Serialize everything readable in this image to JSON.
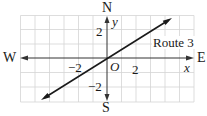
{
  "diagram": {
    "type": "coordinate-plane-with-route",
    "compass": {
      "north": "N",
      "south": "S",
      "east": "E",
      "west": "W"
    },
    "axes": {
      "x_label": "x",
      "y_label": "y",
      "origin_label": "O"
    },
    "ticks": {
      "x_neg": "−2",
      "x_pos": "2",
      "y_pos": "2",
      "y_neg": "−2"
    },
    "route_label": "Route 3",
    "route_equation_estimate": "y = (2/3)x",
    "grid": {
      "x_range": [
        -6,
        6
      ],
      "y_range": [
        -3,
        3
      ],
      "step": 1
    },
    "colors": {
      "grid": "#d4d4d4",
      "axis": "#333333",
      "line": "#1a1a1a",
      "text": "#1a1a1a"
    }
  }
}
